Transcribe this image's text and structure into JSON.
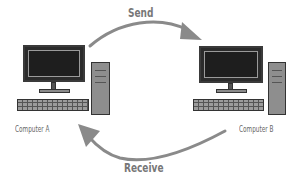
{
  "diagram": {
    "arrows": {
      "send": {
        "label": "Send",
        "direction": "Computer A -> Computer B"
      },
      "receive": {
        "label": "Receive",
        "direction": "Computer B -> Computer A"
      },
      "color": "#8a8a8a"
    },
    "nodes": [
      {
        "id": "computer-a",
        "label": "Computer A",
        "icon": "desktop-computer-icon"
      },
      {
        "id": "computer-b",
        "label": "Computer B",
        "icon": "desktop-computer-icon"
      }
    ],
    "colors": {
      "screen": "#1e1e1e",
      "frame": "#3a3a3a",
      "tower": "#8e8e8e",
      "text": "#666666"
    }
  }
}
